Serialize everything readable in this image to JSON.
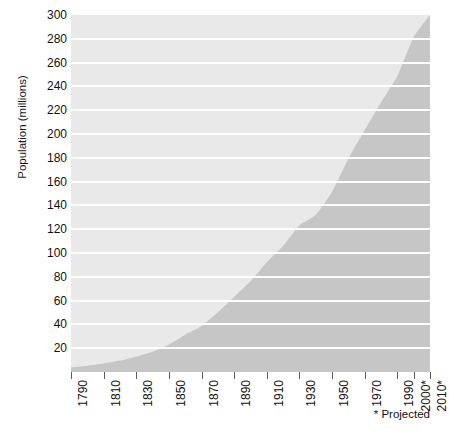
{
  "chart_data": {
    "type": "area",
    "title": "",
    "subtitle": "",
    "xlabel": "",
    "ylabel": "Population (millions)",
    "ylim": [
      0,
      300
    ],
    "xlim": [
      1790,
      2010
    ],
    "grid": true,
    "legend_position": "none",
    "annotations": [
      "* Projected"
    ],
    "yticks": [
      300,
      280,
      260,
      240,
      220,
      200,
      180,
      160,
      140,
      120,
      100,
      80,
      60,
      40,
      20
    ],
    "xticks": [
      "1790",
      "1810",
      "1830",
      "1850",
      "1870",
      "1890",
      "1910",
      "1930",
      "1950",
      "1970",
      "1990",
      "2000*",
      "2010*"
    ],
    "xtick_years": [
      1790,
      1810,
      1830,
      1850,
      1870,
      1890,
      1910,
      1930,
      1950,
      1970,
      1990,
      2000,
      2010
    ],
    "series": [
      {
        "name": "Population (millions)",
        "x": [
          1790,
          1800,
          1810,
          1820,
          1830,
          1840,
          1850,
          1860,
          1870,
          1880,
          1890,
          1900,
          1910,
          1920,
          1930,
          1940,
          1950,
          1960,
          1970,
          1980,
          1990,
          2000,
          2010
        ],
        "values": [
          3.9,
          5.3,
          7.2,
          9.6,
          12.9,
          17.1,
          23.2,
          31.4,
          38.6,
          50.2,
          63.0,
          76.2,
          92.2,
          106.0,
          123.2,
          132.2,
          151.3,
          179.3,
          203.3,
          226.5,
          248.7,
          281.4,
          300.0
        ]
      }
    ],
    "colors": {
      "plot_background": "#e9e9e9",
      "gridline": "#fdfdfd",
      "area_fill": "#c6c6c6",
      "text": "#111111",
      "tick": "#5d5d5d"
    }
  },
  "footnote": {
    "text": "* Projected"
  }
}
